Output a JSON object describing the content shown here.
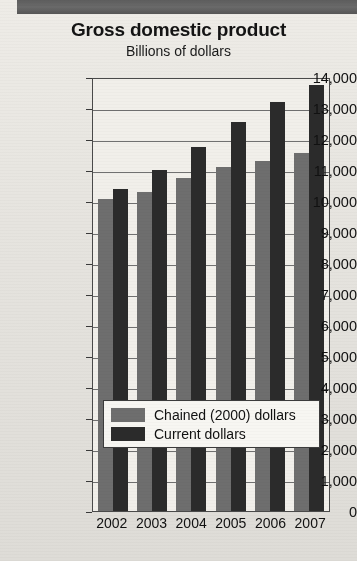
{
  "chart_data": {
    "type": "bar",
    "title": "Gross domestic product",
    "subtitle": "Billions of dollars",
    "xlabel": "",
    "ylabel": "Billions of dollars",
    "categories": [
      "2002",
      "2003",
      "2004",
      "2005",
      "2006",
      "2007"
    ],
    "series": [
      {
        "name": "Chained (2000) dollars",
        "color": "#6e6e6e",
        "values": [
          10050,
          10300,
          10750,
          11100,
          11300,
          11550
        ]
      },
      {
        "name": "Current dollars",
        "color": "#2b2b2b",
        "values": [
          10400,
          11000,
          11750,
          12550,
          13200,
          13750
        ]
      }
    ],
    "ylim": [
      0,
      14000
    ],
    "ytick_values": [
      0,
      1000,
      2000,
      3000,
      4000,
      5000,
      6000,
      7000,
      8000,
      9000,
      10000,
      11000,
      12000,
      13000,
      14000
    ],
    "ytick_labels": [
      "0",
      "1,000",
      "2,000",
      "3,000",
      "4,000",
      "5,000",
      "6,000",
      "7,000",
      "8,000",
      "9,000",
      "10,000",
      "11,000",
      "12,000",
      "13,000",
      "14,000"
    ],
    "grid": true,
    "legend_position": "inside-bottom-center"
  },
  "legend": {
    "entries": [
      {
        "label": "Chained (2000) dollars",
        "color": "#6e6e6e"
      },
      {
        "label": "Current dollars",
        "color": "#2b2b2b"
      }
    ]
  },
  "colors": {
    "chained": "#6e6e6e",
    "current": "#2b2b2b",
    "band": "#5d5d5d",
    "page": "#e8e7e2"
  }
}
